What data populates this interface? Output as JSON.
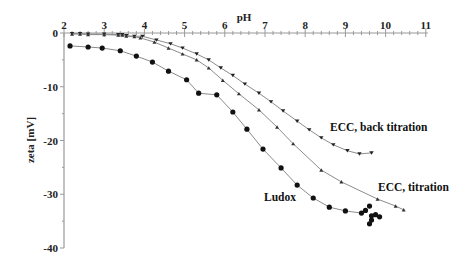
{
  "chart_data": {
    "type": "line",
    "title": "",
    "xlabel": "pH",
    "ylabel": "zeta [mV]",
    "xlim": [
      2,
      11
    ],
    "ylim": [
      -40,
      0
    ],
    "x_ticks": [
      "2",
      "3",
      "4",
      "5",
      "6",
      "7",
      "8",
      "9",
      "10",
      "11"
    ],
    "y_ticks": [
      "0",
      "-10",
      "-20",
      "-30",
      "-40"
    ],
    "x_axis_position": "top",
    "grid": false,
    "legend": "inline labels",
    "series": [
      {
        "name": "ECC, back titration",
        "marker": "triangle-down",
        "label_pos": [
          330,
          130
        ],
        "x": [
          2.2,
          2.4,
          2.6,
          3.0,
          3.35,
          3.45,
          3.55,
          3.75,
          3.95,
          4.3,
          4.65,
          4.95,
          5.3,
          5.6,
          5.9,
          6.2,
          6.5,
          6.85,
          7.15,
          7.45,
          7.8,
          8.1,
          8.4,
          8.7,
          9.05,
          9.35,
          9.65
        ],
        "y": [
          -0.1,
          -0.1,
          -0.2,
          -0.2,
          -0.3,
          -0.3,
          -0.5,
          -0.6,
          -0.6,
          -1.3,
          -2.0,
          -2.8,
          -3.9,
          -5.0,
          -6.5,
          -7.9,
          -9.5,
          -11.2,
          -12.8,
          -14.5,
          -16.4,
          -18.0,
          -19.5,
          -20.8,
          -21.9,
          -22.5,
          -22.3
        ]
      },
      {
        "name": "ECC, titration",
        "marker": "triangle-up",
        "label_pos": [
          378,
          190
        ],
        "x": [
          2.2,
          2.4,
          2.6,
          3.0,
          3.35,
          3.45,
          3.55,
          3.75,
          3.9,
          4.25,
          4.6,
          4.95,
          5.3,
          5.6,
          5.95,
          6.35,
          6.85,
          7.3,
          7.7,
          8.4,
          8.9,
          9.8,
          10.25,
          10.45
        ],
        "y": [
          -0.2,
          -0.2,
          -0.3,
          -0.3,
          -0.4,
          -0.4,
          -0.6,
          -0.7,
          -0.9,
          -1.7,
          -2.8,
          -3.9,
          -5.0,
          -6.5,
          -8.8,
          -11.3,
          -14.3,
          -17.5,
          -20.6,
          -25.5,
          -27.7,
          -30.9,
          -32.2,
          -32.9
        ]
      },
      {
        "name": "Ludox",
        "marker": "circle",
        "label_pos": [
          264,
          200
        ],
        "x": [
          2.15,
          2.6,
          2.95,
          3.4,
          3.8,
          4.2,
          4.6,
          5.05,
          5.35,
          5.8,
          6.2,
          6.55,
          6.95,
          7.4,
          7.8,
          8.2,
          8.6,
          9.0,
          9.4,
          9.5,
          9.6,
          9.65,
          9.65,
          9.6,
          9.75,
          9.85
        ],
        "y": [
          -2.4,
          -2.6,
          -2.8,
          -3.3,
          -4.3,
          -5.4,
          -7.1,
          -8.7,
          -11.2,
          -11.5,
          -14.7,
          -17.9,
          -21.6,
          -25.1,
          -28.3,
          -30.7,
          -32.4,
          -33.1,
          -33.5,
          -33.0,
          -32.2,
          -34.0,
          -34.8,
          -35.5,
          -33.8,
          -34.2
        ]
      }
    ]
  },
  "labels": {
    "xlabel": "pH",
    "ylabel": "zeta [mV]",
    "back_titration": "ECC, back titration",
    "titration": "ECC, titration",
    "ludox": "Ludox"
  }
}
